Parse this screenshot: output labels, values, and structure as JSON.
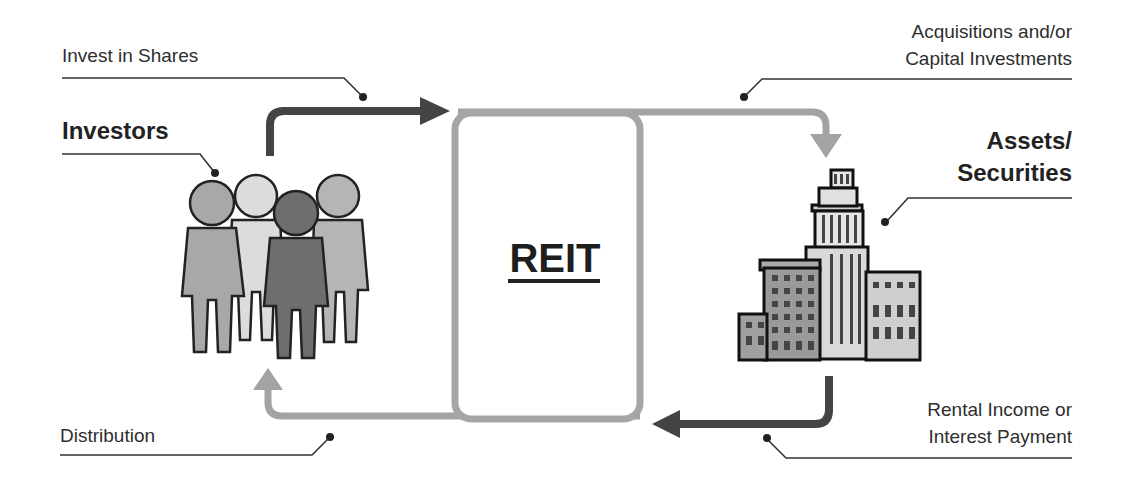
{
  "diagram": {
    "center": {
      "label": "REIT"
    },
    "entities": {
      "investors": {
        "label": "Investors",
        "icon": "group-of-people-icon"
      },
      "assets": {
        "label_line1": "Assets/",
        "label_line2": "Securities",
        "icon": "office-buildings-icon"
      }
    },
    "flows": [
      {
        "id": "invest",
        "label": "Invest in Shares",
        "from": "Investors",
        "to": "REIT",
        "color": "#444444"
      },
      {
        "id": "acquire",
        "label_line1": "Acquisitions and/or",
        "label_line2": "Capital Investments",
        "from": "REIT",
        "to": "Assets/Securities",
        "color": "#9a9a9a"
      },
      {
        "id": "income",
        "label_line1": "Rental Income or",
        "label_line2": "Interest Payment",
        "from": "Assets/Securities",
        "to": "REIT",
        "color": "#444444"
      },
      {
        "id": "distribution",
        "label": "Distribution",
        "from": "REIT",
        "to": "Investors",
        "color": "#9a9a9a"
      }
    ],
    "colors": {
      "dark_arrow": "#444444",
      "light_arrow": "#a0a0a0",
      "box_border": "#a6a6a6",
      "leader_line": "#333333"
    }
  }
}
